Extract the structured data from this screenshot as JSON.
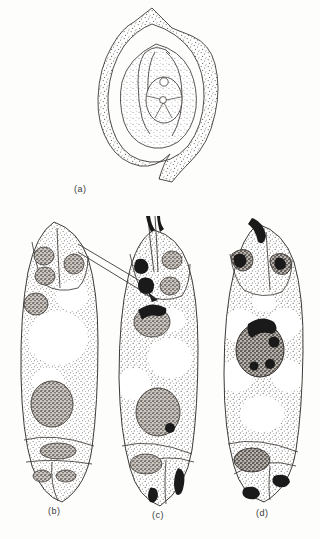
{
  "figure": {
    "background_color": "#fdfdfc",
    "ink_color": "#3d3a37",
    "stipple_color": "#6b6661",
    "dark_fill_color": "#1a1a1a",
    "nucleus_fill_color": "#8f8a84",
    "panels": [
      {
        "id": "a",
        "label": "(a)",
        "caption_text": "(a)",
        "description": "Longitudinal section of an anatropous ovule showing integument, nucellus and the young embryo sac with egg apparatus",
        "structures": [
          "outer integument",
          "inner integument",
          "nucellus",
          "micropyle",
          "embryo sac",
          "egg apparatus",
          "central cell"
        ]
      },
      {
        "id": "b",
        "label": "(b)",
        "caption_text": "(b)",
        "description": "Mature embryo sac before fertilization with two synergids, egg cell, secondary nucleus, central vacuoles and antipodal cells",
        "nuclei_count": 7,
        "vacuole_count": 3,
        "structures": [
          "synergid",
          "synergid",
          "egg cell nucleus",
          "polar nucleus",
          "secondary nucleus",
          "central vacuole",
          "antipodal cell"
        ]
      },
      {
        "id": "c",
        "label": "(c)",
        "caption_text": "(c)",
        "description": "Embryo sac penetrated by a pollen tube; darkly stained male gametes discharged near the egg apparatus and the secondary nucleus",
        "nuclei_count": 7,
        "vacuole_count": 3,
        "has_pollen_tube": true,
        "structures": [
          "pollen tube",
          "discharged male gamete",
          "synergid",
          "egg cell nucleus",
          "secondary nucleus",
          "central vacuole",
          "antipodal cell"
        ]
      },
      {
        "id": "d",
        "label": "(d)",
        "caption_text": "(d)",
        "description": "Embryo sac after double fertilization; the second male gamete fuses with the secondary nucleus to form the primary endosperm nucleus",
        "nuclei_count": 6,
        "vacuole_count": 6,
        "structures": [
          "fertilized egg (zygote)",
          "male gamete",
          "primary endosperm nucleus",
          "central vacuole",
          "antipodal cell"
        ]
      }
    ]
  }
}
